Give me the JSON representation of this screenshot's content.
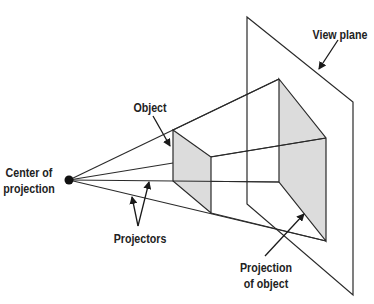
{
  "diagram": {
    "labels": {
      "view_plane": "View plane",
      "object": "Object",
      "center_line1": "Center of",
      "center_line2": "projection",
      "projectors": "Projectors",
      "projection_line1": "Projection",
      "projection_line2": "of object"
    },
    "colors": {
      "stroke": "#2a2a2a",
      "fill_shaded": "#dcdcdc",
      "text": "#222222"
    },
    "elements": [
      {
        "id": "center-of-projection",
        "type": "point"
      },
      {
        "id": "object",
        "type": "quadrilateral",
        "shaded": true
      },
      {
        "id": "projection-of-object",
        "type": "quadrilateral",
        "shaded": true
      },
      {
        "id": "view-plane",
        "type": "quadrilateral",
        "shaded": false
      },
      {
        "id": "projectors",
        "type": "lines",
        "count": 4
      }
    ]
  }
}
